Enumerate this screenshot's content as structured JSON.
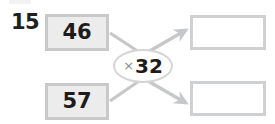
{
  "exercise": {
    "number": "15",
    "type": "function-machine"
  },
  "inputs": [
    {
      "label": "46"
    },
    {
      "label": "57"
    }
  ],
  "operator": {
    "sign": "×",
    "value": "32",
    "full": "×32"
  },
  "outputs": [
    {
      "value": ""
    },
    {
      "value": ""
    }
  ],
  "colors": {
    "input_fill": "#ececed",
    "input_border": "#c9c9ca",
    "output_fill": "#ffffff",
    "output_border": "#cfd0d1",
    "oval_border": "#d5d5d6",
    "connector": "#c6c7c8",
    "text": "#1d1b1b",
    "operator_sign": "#8c8c8d"
  },
  "connectors": [
    {
      "from": "input-top",
      "to": "operator",
      "arrow": false
    },
    {
      "from": "input-bottom",
      "to": "operator",
      "arrow": false
    },
    {
      "from": "operator",
      "to": "output-top",
      "arrow": true
    },
    {
      "from": "operator",
      "to": "output-bottom",
      "arrow": true
    }
  ]
}
